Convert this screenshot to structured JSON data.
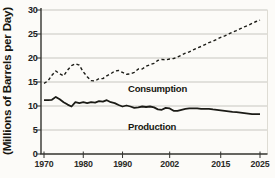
{
  "colors": {
    "background": "#fcfbf8",
    "line": "#1b1b16",
    "grid": "#c7c6c0",
    "axis": "#33332e",
    "text": "#21211e",
    "right_edge": "#dedcd4"
  },
  "chart_data": {
    "type": "line",
    "title": "",
    "xlabel": "",
    "ylabel": "(Millions of Barrels per Day)",
    "xlim": [
      1970,
      2025
    ],
    "ylim": [
      0,
      30
    ],
    "yticks": [
      0,
      5,
      10,
      15,
      20,
      25,
      30
    ],
    "xticks": [
      1970,
      1980,
      1990,
      2002,
      2015,
      2025
    ],
    "grid": "horizontal-only",
    "legend_position": "inline-labels-on-plot",
    "x": [
      1970,
      1971,
      1972,
      1973,
      1974,
      1975,
      1976,
      1977,
      1978,
      1979,
      1980,
      1981,
      1982,
      1983,
      1984,
      1985,
      1986,
      1987,
      1988,
      1989,
      1990,
      1991,
      1992,
      1993,
      1994,
      1995,
      1996,
      1997,
      1998,
      1999,
      2000,
      2001,
      2002,
      2003,
      2004,
      2005,
      2006,
      2007,
      2008,
      2009,
      2010,
      2011,
      2012,
      2013,
      2014,
      2015,
      2016,
      2017,
      2018,
      2019,
      2020,
      2021,
      2022,
      2023,
      2024,
      2025
    ],
    "series": [
      {
        "name": "Consumption",
        "style": "dashed",
        "values": [
          14.7,
          15.2,
          16.4,
          17.3,
          16.7,
          16.3,
          17.5,
          18.4,
          18.8,
          18.5,
          17.1,
          16.1,
          15.3,
          15.2,
          15.7,
          15.7,
          16.3,
          16.7,
          17.3,
          17.4,
          17.0,
          16.6,
          16.7,
          17.0,
          17.7,
          17.7,
          18.3,
          18.6,
          18.9,
          19.5,
          19.7,
          19.6,
          19.8,
          19.9,
          20.2,
          20.6,
          21.0,
          21.3,
          21.7,
          22.1,
          22.4,
          22.8,
          23.2,
          23.5,
          23.9,
          24.3,
          24.6,
          25.0,
          25.4,
          25.7,
          26.1,
          26.5,
          26.8,
          27.2,
          27.6,
          27.9
        ]
      },
      {
        "name": "Production",
        "style": "solid",
        "values": [
          11.2,
          11.2,
          11.3,
          11.9,
          11.4,
          10.8,
          10.3,
          9.9,
          10.8,
          10.6,
          10.8,
          10.6,
          10.8,
          10.7,
          11.0,
          10.9,
          11.2,
          10.8,
          10.6,
          10.2,
          9.9,
          10.1,
          9.9,
          9.6,
          9.7,
          9.9,
          9.8,
          9.9,
          9.7,
          9.3,
          9.2,
          9.6,
          9.5,
          9.0,
          9.0,
          9.2,
          9.4,
          9.5,
          9.5,
          9.5,
          9.4,
          9.4,
          9.4,
          9.3,
          9.2,
          9.1,
          9.0,
          8.9,
          8.8,
          8.7,
          8.6,
          8.5,
          8.4,
          8.3,
          8.3,
          8.3
        ]
      }
    ]
  }
}
